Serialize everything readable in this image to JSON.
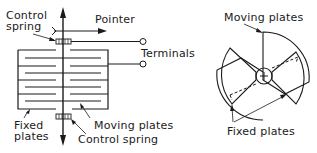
{
  "left_figure": {
    "labels": {
      "control_spring_top_line1": "Control",
      "control_spring_top_line2": "spring",
      "pointer": "Pointer",
      "terminals": "Terminals",
      "fixed_plates_line1": "Fixed",
      "fixed_plates_line2": "plates",
      "moving_plates": "Moving plates",
      "control_spring_bottom": "Control spring"
    }
  },
  "right_figure": {
    "labels": {
      "moving_plates": "Moving plates",
      "fixed_plates": "Fixed plates"
    }
  },
  "colors": {
    "ink": "#1a1a1a",
    "background": "#ffffff"
  }
}
